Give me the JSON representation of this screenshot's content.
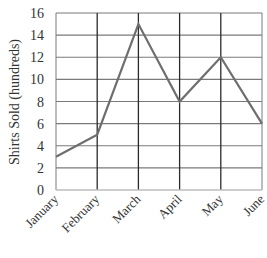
{
  "chart_data": {
    "type": "line",
    "title": "",
    "xlabel": "",
    "ylabel": "Shirts Sold (hundreds)",
    "categories": [
      "January",
      "February",
      "March",
      "April",
      "May",
      "June"
    ],
    "series": [
      {
        "name": "Shirts Sold",
        "values": [
          3,
          5,
          15,
          8,
          12,
          6
        ],
        "color": "#666666"
      }
    ],
    "ylim": [
      0,
      16
    ],
    "yticks": [
      0,
      2,
      4,
      6,
      8,
      10,
      12,
      14,
      16
    ],
    "grid": true,
    "legend": null
  },
  "colors": {
    "line": "#6e6e6e",
    "horizontal_grid": "#7a7a7a",
    "vertical_grid": "#2a2a2a",
    "axis": "#bdbdbd",
    "text": "#333333"
  }
}
